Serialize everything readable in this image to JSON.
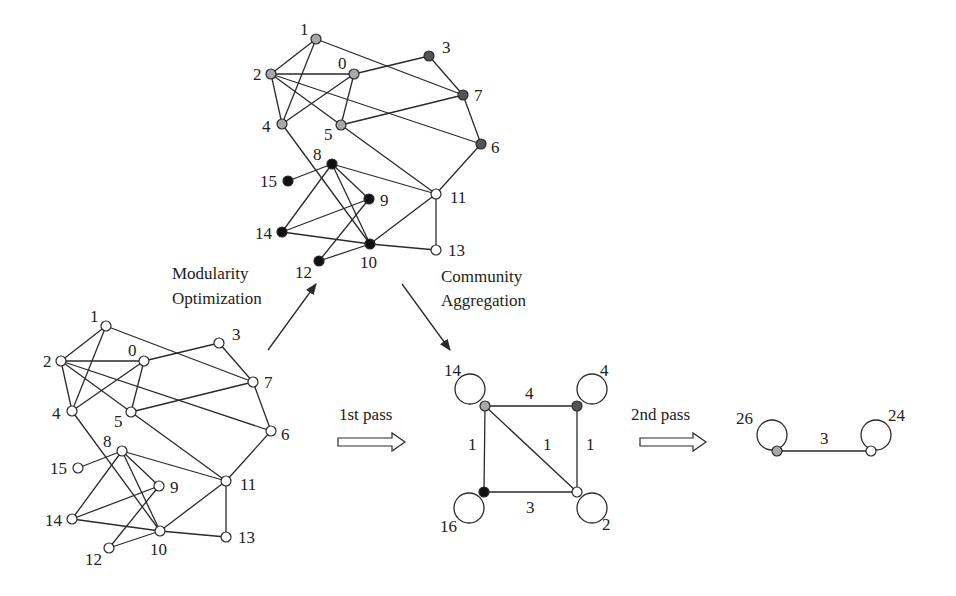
{
  "colors": {
    "light_gray": "#a8a8a8",
    "dark_gray": "#555555",
    "black": "#111111",
    "white": "#ffffff",
    "edge": "#2a2a2a"
  },
  "original_graph": {
    "nodes": [
      {
        "id": "0",
        "x": 144,
        "y": 361,
        "lx": 128,
        "ly": 356
      },
      {
        "id": "1",
        "x": 106,
        "y": 326,
        "lx": 90,
        "ly": 322
      },
      {
        "id": "2",
        "x": 61,
        "y": 361,
        "lx": 43,
        "ly": 367
      },
      {
        "id": "3",
        "x": 219,
        "y": 343,
        "lx": 232,
        "ly": 340
      },
      {
        "id": "4",
        "x": 72,
        "y": 411,
        "lx": 52,
        "ly": 419
      },
      {
        "id": "5",
        "x": 131,
        "y": 412,
        "lx": 114,
        "ly": 427
      },
      {
        "id": "6",
        "x": 271,
        "y": 431,
        "lx": 281,
        "ly": 440
      },
      {
        "id": "7",
        "x": 253,
        "y": 382,
        "lx": 264,
        "ly": 388
      },
      {
        "id": "8",
        "x": 122,
        "y": 451,
        "lx": 103,
        "ly": 447
      },
      {
        "id": "9",
        "x": 159,
        "y": 486,
        "lx": 170,
        "ly": 493
      },
      {
        "id": "10",
        "x": 160,
        "y": 531,
        "lx": 150,
        "ly": 555
      },
      {
        "id": "11",
        "x": 226,
        "y": 481,
        "lx": 240,
        "ly": 490
      },
      {
        "id": "12",
        "x": 109,
        "y": 548,
        "lx": 85,
        "ly": 565
      },
      {
        "id": "13",
        "x": 226,
        "y": 537,
        "lx": 238,
        "ly": 543
      },
      {
        "id": "14",
        "x": 72,
        "y": 519,
        "lx": 45,
        "ly": 526
      },
      {
        "id": "15",
        "x": 78,
        "y": 468,
        "lx": 50,
        "ly": 474
      }
    ],
    "edges": [
      [
        "1",
        "2"
      ],
      [
        "1",
        "4"
      ],
      [
        "1",
        "7"
      ],
      [
        "2",
        "0"
      ],
      [
        "2",
        "4"
      ],
      [
        "2",
        "5"
      ],
      [
        "2",
        "6"
      ],
      [
        "0",
        "4"
      ],
      [
        "0",
        "5"
      ],
      [
        "0",
        "3"
      ],
      [
        "3",
        "7"
      ],
      [
        "5",
        "7"
      ],
      [
        "7",
        "6"
      ],
      [
        "4",
        "10"
      ],
      [
        "5",
        "11"
      ],
      [
        "6",
        "11"
      ],
      [
        "8",
        "15"
      ],
      [
        "8",
        "14"
      ],
      [
        "8",
        "9"
      ],
      [
        "8",
        "10"
      ],
      [
        "8",
        "11"
      ],
      [
        "9",
        "14"
      ],
      [
        "9",
        "12"
      ],
      [
        "14",
        "10"
      ],
      [
        "10",
        "12"
      ],
      [
        "10",
        "11"
      ],
      [
        "10",
        "13"
      ],
      [
        "11",
        "13"
      ]
    ]
  },
  "partitioned_graph": {
    "dx": 210,
    "dy": -287,
    "node_colors": {
      "0": "light_gray",
      "1": "light_gray",
      "2": "light_gray",
      "4": "light_gray",
      "5": "light_gray",
      "3": "dark_gray",
      "6": "dark_gray",
      "7": "dark_gray",
      "8": "black",
      "9": "black",
      "10": "black",
      "12": "black",
      "14": "black",
      "15": "black",
      "11": "white",
      "13": "white"
    }
  },
  "labels": {
    "modularity_line1": "Modularity",
    "modularity_line2": "Optimization",
    "aggregation_line1": "Community",
    "aggregation_line2": "Aggregation",
    "first_pass": "1st pass",
    "second_pass": "2nd pass"
  },
  "first_pass_graph": {
    "nodes": [
      {
        "name": "A",
        "x": 485,
        "y": 406,
        "color": "light_gray",
        "loop": {
          "cx": 470,
          "cy": 389
        },
        "loop_label": "14",
        "lx": 444,
        "ly": 376
      },
      {
        "name": "B",
        "x": 577,
        "y": 406,
        "color": "dark_gray",
        "loop": {
          "cx": 592,
          "cy": 389
        },
        "loop_label": "4",
        "lx": 600,
        "ly": 376
      },
      {
        "name": "C",
        "x": 484,
        "y": 492,
        "color": "black",
        "loop": {
          "cx": 469,
          "cy": 508
        },
        "loop_label": "16",
        "lx": 440,
        "ly": 532
      },
      {
        "name": "D",
        "x": 577,
        "y": 492,
        "color": "white",
        "loop": {
          "cx": 592,
          "cy": 508
        },
        "loop_label": "2",
        "lx": 602,
        "ly": 530
      }
    ],
    "edges": [
      {
        "from": "A",
        "to": "B",
        "weight": "4",
        "lx": 525,
        "ly": 399
      },
      {
        "from": "A",
        "to": "C",
        "weight": "1",
        "lx": 468,
        "ly": 450
      },
      {
        "from": "A",
        "to": "D",
        "weight": "1",
        "lx": 543,
        "ly": 450
      },
      {
        "from": "B",
        "to": "D",
        "weight": "1",
        "lx": 586,
        "ly": 450
      },
      {
        "from": "C",
        "to": "D",
        "weight": "3",
        "lx": 526,
        "ly": 513
      }
    ]
  },
  "second_pass_graph": {
    "nodes": [
      {
        "name": "L",
        "x": 777,
        "y": 451,
        "color": "light_gray",
        "loop": {
          "cx": 772,
          "cy": 435
        },
        "loop_label": "26",
        "lx": 736,
        "ly": 424
      },
      {
        "name": "R",
        "x": 871,
        "y": 451,
        "color": "white",
        "loop": {
          "cx": 876,
          "cy": 435
        },
        "loop_label": "24",
        "lx": 888,
        "ly": 421
      }
    ],
    "edges": [
      {
        "from": "L",
        "to": "R",
        "weight": "3",
        "lx": 820,
        "ly": 444
      }
    ]
  }
}
